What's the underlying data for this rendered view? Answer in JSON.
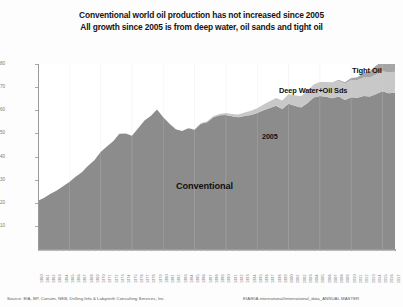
{
  "titles": {
    "line1": "Conventional world oil production has not increased since 2005",
    "line2": "All growth since 2005 is from deep water, oil sands and tight oil"
  },
  "annotations": {
    "tight_oil": "Tight Oil",
    "deep_water": "Deep Water+Oil Sds",
    "year_marker": "2005",
    "conventional": "Conventional"
  },
  "footer": {
    "left": "Source: EIA, BP, Cansim, NEB, Drilling Info & Labyrinth Consulting Services, Inc.",
    "right": "EIA/EIA international/international_data_ANNUAL  MASTER"
  },
  "colors": {
    "conventional": "#8c8c8c",
    "deep_water": "#c8c8c8",
    "tight_oil": "#a5a5a5",
    "axis": "#9a9a9a",
    "text": "#151515",
    "background": "#ffffff"
  },
  "chart_data": {
    "type": "area",
    "stacked": true,
    "title": "Conventional world oil production has not increased since 2005",
    "subtitle": "All growth since 2005 is from deep water, oil sands and tight oil",
    "xlabel": "",
    "ylabel": "World Crude + Condensate Production (mmb/d)",
    "ylim": [
      0,
      80
    ],
    "yticks": [
      10,
      20,
      30,
      40,
      50,
      60,
      70,
      80
    ],
    "grid": false,
    "legend_position": "inline-annotations",
    "x": [
      1960,
      1961,
      1962,
      1963,
      1964,
      1965,
      1966,
      1967,
      1968,
      1969,
      1970,
      1971,
      1972,
      1973,
      1974,
      1975,
      1976,
      1977,
      1978,
      1979,
      1980,
      1981,
      1982,
      1983,
      1984,
      1985,
      1986,
      1987,
      1988,
      1989,
      1990,
      1991,
      1992,
      1993,
      1994,
      1995,
      1996,
      1997,
      1998,
      1999,
      2000,
      2001,
      2002,
      2003,
      2004,
      2005,
      2006,
      2007,
      2008,
      2009,
      2010,
      2011,
      2012,
      2013,
      2014,
      2015,
      2016,
      2017
    ],
    "series": [
      {
        "name": "Conventional",
        "color": "#8c8c8c",
        "values": [
          20.9,
          22.2,
          23.9,
          25.3,
          27.1,
          29.0,
          31.2,
          33.2,
          36.0,
          38.4,
          42.0,
          44.3,
          46.6,
          49.8,
          50.0,
          49.0,
          52.2,
          55.6,
          57.5,
          60.3,
          57.0,
          54.2,
          51.8,
          51.0,
          52.2,
          51.6,
          54.2,
          54.8,
          57.0,
          57.8,
          58.0,
          57.4,
          57.0,
          57.5,
          58.0,
          58.8,
          60.0,
          61.0,
          62.0,
          60.5,
          62.8,
          62.0,
          61.2,
          63.0,
          65.5,
          66.2,
          65.8,
          65.2,
          66.0,
          64.4,
          65.6,
          65.4,
          66.2,
          66.0,
          67.0,
          68.2,
          67.4,
          67.6
        ]
      },
      {
        "name": "Deep Water+Oil Sands",
        "color": "#c8c8c8",
        "values": [
          0,
          0,
          0,
          0,
          0,
          0,
          0,
          0,
          0,
          0,
          0,
          0,
          0,
          0,
          0,
          0,
          0,
          0,
          0,
          0,
          0,
          0,
          0,
          0,
          0.1,
          0.2,
          0.3,
          0.4,
          0.5,
          0.6,
          0.8,
          1.0,
          1.2,
          1.5,
          1.8,
          2.1,
          2.5,
          2.9,
          3.3,
          3.7,
          4.1,
          4.5,
          4.9,
          5.2,
          5.6,
          6.0,
          6.3,
          6.6,
          6.9,
          7.2,
          7.5,
          7.7,
          8.0,
          8.2,
          8.5,
          8.7,
          8.9,
          9.1
        ]
      },
      {
        "name": "Tight Oil",
        "color": "#a5a5a5",
        "values": [
          0,
          0,
          0,
          0,
          0,
          0,
          0,
          0,
          0,
          0,
          0,
          0,
          0,
          0,
          0,
          0,
          0,
          0,
          0,
          0,
          0,
          0,
          0,
          0,
          0,
          0,
          0,
          0,
          0,
          0,
          0,
          0,
          0,
          0,
          0,
          0,
          0,
          0,
          0,
          0,
          0,
          0,
          0,
          0,
          0,
          0,
          0.1,
          0.2,
          0.3,
          0.5,
          0.8,
          1.2,
          1.9,
          2.8,
          3.8,
          4.4,
          4.2,
          4.6
        ]
      }
    ]
  }
}
